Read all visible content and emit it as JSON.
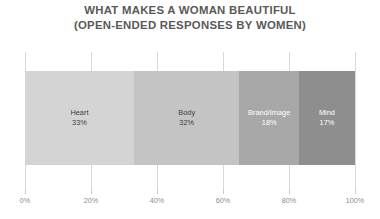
{
  "chart_data": {
    "type": "bar",
    "orientation": "horizontal-stacked",
    "title": "WHAT MAKES A WOMAN BEAUTIFUL",
    "subtitle": "(OPEN-ENDED RESPONSES BY WOMEN)",
    "xlabel": "",
    "ylabel": "",
    "xlim": [
      0,
      100
    ],
    "grid": true,
    "legend": "none",
    "categories": [
      "Heart",
      "Body",
      "Brand/Image",
      "Mind"
    ],
    "values": [
      33,
      32,
      18,
      17
    ],
    "value_labels": [
      "33%",
      "32%",
      "18%",
      "17%"
    ],
    "colors": [
      "#d4d4d4",
      "#c4c4c4",
      "#a8a8a8",
      "#8e8e8e"
    ],
    "label_text_colors": [
      "#404040",
      "#404040",
      "#ffffff",
      "#ffffff"
    ],
    "xticks": [
      0,
      20,
      40,
      60,
      80,
      100
    ],
    "xtick_labels": [
      "0%",
      "20%",
      "40%",
      "60%",
      "80%",
      "100%"
    ],
    "segments": [
      {
        "label": "Heart",
        "value_label": "33%",
        "value": 33,
        "color": "#d4d4d4",
        "text_tone": "dark"
      },
      {
        "label": "Body",
        "value_label": "32%",
        "value": 32,
        "color": "#c4c4c4",
        "text_tone": "dark"
      },
      {
        "label": "Brand/Image",
        "value_label": "18%",
        "value": 18,
        "color": "#a8a8a8",
        "text_tone": "light"
      },
      {
        "label": "Mind",
        "value_label": "17%",
        "value": 17,
        "color": "#8e8e8e",
        "text_tone": "light"
      }
    ]
  },
  "style": {
    "background": "#ffffff",
    "title_color": "#595959",
    "gridline_color": "#d9d9d9",
    "tick_label_color": "#8c8c8c",
    "tick_mark_color": "#c9c9c9"
  }
}
